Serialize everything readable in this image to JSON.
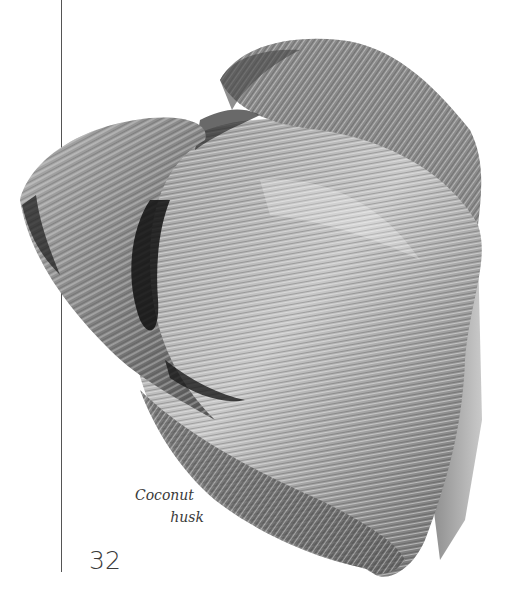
{
  "page": {
    "background": "#ffffff",
    "rule_color": "#555555"
  },
  "photo": {
    "subject": "coconut husk",
    "style": "black-and-white photograph"
  },
  "caption": {
    "line1": "Coconut",
    "line2": "husk"
  },
  "page_number": "32"
}
